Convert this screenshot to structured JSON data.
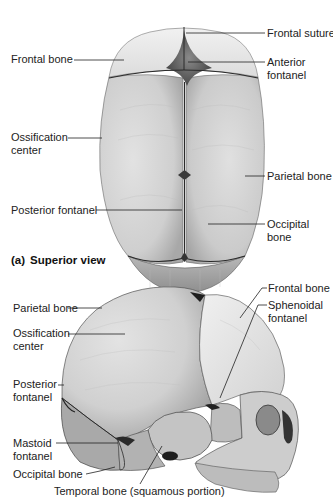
{
  "figure": {
    "panel_a": {
      "caption_letter": "(a)",
      "caption_title": "Superior view",
      "labels": {
        "frontal_bone": "Frontal bone",
        "frontal_suture": "Frontal suture",
        "anterior_fontanel_1": "Anterior",
        "anterior_fontanel_2": "fontanel",
        "ossification_center_1": "Ossification",
        "ossification_center_2": "center",
        "parietal_bone": "Parietal bone",
        "posterior_fontanel": "Posterior fontanel",
        "occipital_bone_1": "Occipital",
        "occipital_bone_2": "bone"
      }
    },
    "panel_b": {
      "labels": {
        "frontal_bone": "Frontal bone",
        "sphenoidal_fontanel_1": "Sphenoidal",
        "sphenoidal_fontanel_2": "fontanel",
        "parietal_bone": "Parietal bone",
        "ossification_center_1": "Ossification",
        "ossification_center_2": "center",
        "posterior_fontanel_1": "Posterior",
        "posterior_fontanel_2": "fontanel",
        "mastoid_fontanel_1": "Mastoid",
        "mastoid_fontanel_2": "fontanel",
        "occipital_bone": "Occipital bone",
        "temporal_bone": "Temporal bone (squamous portion)"
      }
    },
    "colors": {
      "bone_light": "#e6e6e6",
      "bone_mid": "#c9c9c9",
      "bone_dark": "#9a9a9a",
      "suture": "#2a2a2a",
      "leader": "#222222"
    }
  }
}
